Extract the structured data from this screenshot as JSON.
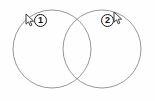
{
  "canvas": {
    "width": 155,
    "height": 101,
    "background_color": "#fefefe",
    "stroke_color": "#8c8c8c",
    "badge_text_color": "#111111",
    "badge_border_color": "#1a1a1a",
    "cursor_color": "#3d3d3d"
  },
  "diagram": {
    "type": "venn-two-circle",
    "circles": [
      {
        "name": "left-circle",
        "cx": 52,
        "cy": 49,
        "r": 39
      },
      {
        "name": "right-circle",
        "cx": 102,
        "cy": 49,
        "r": 39
      }
    ],
    "intersections": [
      {
        "x": 77,
        "y": 19
      },
      {
        "x": 77,
        "y": 79
      }
    ]
  },
  "annotations": {
    "steps": [
      {
        "id": "step-1",
        "label": "1",
        "badge": {
          "x": 34,
          "y": 14
        },
        "cursor": {
          "x": 25,
          "y": 13,
          "name": "mouse-cursor-icon"
        }
      },
      {
        "id": "step-2",
        "label": "2",
        "badge": {
          "x": 101,
          "y": 14
        },
        "cursor": {
          "x": 113,
          "y": 11,
          "name": "mouse-cursor-icon"
        }
      }
    ]
  }
}
